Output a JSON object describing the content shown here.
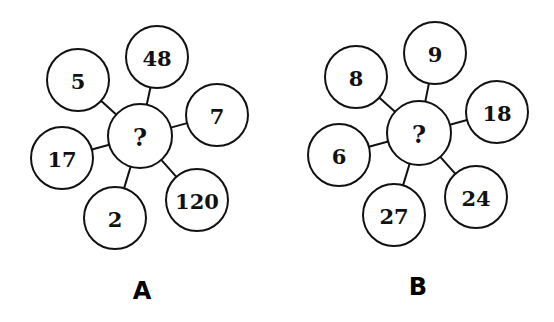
{
  "puzzles": [
    {
      "label": "A",
      "center": {
        "text": "?",
        "x": 140,
        "y": 136
      },
      "label_pos": {
        "x": 142,
        "y": 291
      },
      "petals": [
        {
          "text": "48",
          "x": 157,
          "y": 57
        },
        {
          "text": "7",
          "x": 217,
          "y": 115
        },
        {
          "text": "120",
          "x": 197,
          "y": 200
        },
        {
          "text": "2",
          "x": 115,
          "y": 218
        },
        {
          "text": "17",
          "x": 62,
          "y": 158
        },
        {
          "text": "5",
          "x": 78,
          "y": 80
        }
      ]
    },
    {
      "label": "B",
      "center": {
        "text": "?",
        "x": 419,
        "y": 133
      },
      "label_pos": {
        "x": 418,
        "y": 287
      },
      "petals": [
        {
          "text": "9",
          "x": 435,
          "y": 53
        },
        {
          "text": "18",
          "x": 497,
          "y": 112
        },
        {
          "text": "24",
          "x": 476,
          "y": 197
        },
        {
          "text": "27",
          "x": 394,
          "y": 215
        },
        {
          "text": "6",
          "x": 339,
          "y": 155
        },
        {
          "text": "8",
          "x": 356,
          "y": 77
        }
      ]
    }
  ],
  "style": {
    "stroke": "#111111",
    "background": "#ffffff",
    "radius": 31
  }
}
